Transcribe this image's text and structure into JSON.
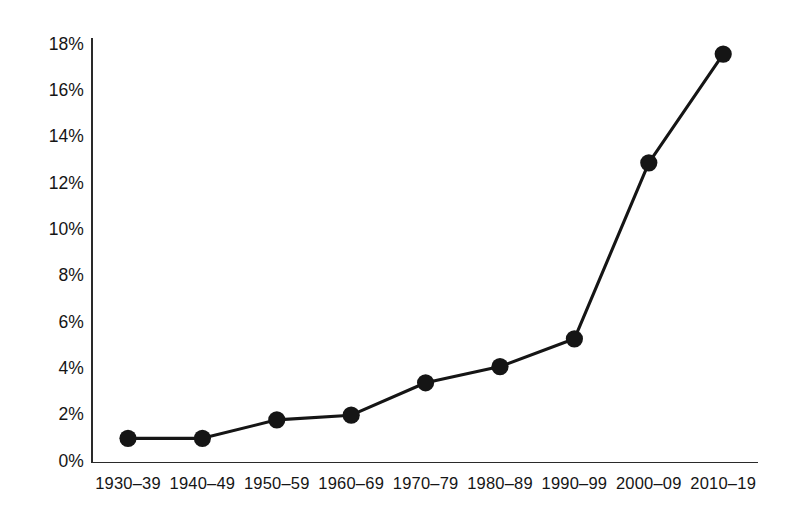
{
  "chart_data": {
    "type": "line",
    "title": "",
    "subtitle": "",
    "xlabel": "",
    "ylabel": "",
    "categories": [
      "1930–39",
      "1940–49",
      "1950–59",
      "1960–69",
      "1970–79",
      "1980–89",
      "1990–99",
      "2000–09",
      "2010–19"
    ],
    "values": [
      1.0,
      1.0,
      1.8,
      2.0,
      3.4,
      4.1,
      5.3,
      12.9,
      17.6
    ],
    "value_unit": "%",
    "ylim": [
      0,
      18
    ],
    "ytick_values": [
      0,
      2,
      4,
      6,
      8,
      10,
      12,
      14,
      16,
      18
    ],
    "ytick_labels": [
      "0%",
      "2%",
      "4%",
      "6%",
      "8%",
      "10%",
      "12%",
      "14%",
      "16%",
      "18%"
    ],
    "grid": false,
    "legend": null,
    "legend_position": "none",
    "annotations": [],
    "series": [
      {
        "name": "",
        "values": [
          1.0,
          1.0,
          1.8,
          2.0,
          3.4,
          4.1,
          5.3,
          12.9,
          17.6
        ],
        "line_color": "#151515",
        "marker_color": "#151515",
        "marker": "circle"
      }
    ]
  },
  "style": {
    "background_color": "#ffffff",
    "axis_color": "#2a2a2a",
    "text_color": "#151515",
    "line_color": "#151515",
    "marker_color": "#151515"
  }
}
